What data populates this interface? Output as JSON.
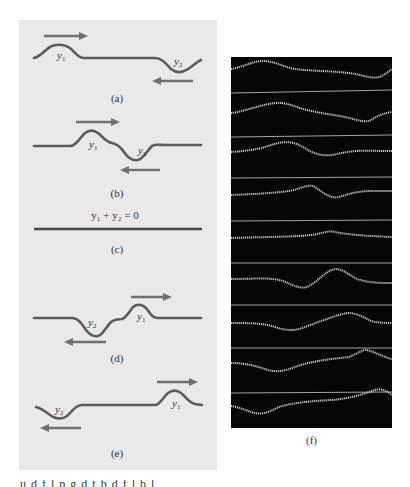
{
  "figure": {
    "panels": [
      {
        "id": "a",
        "caption": "(a)",
        "pulse1_label": "y",
        "pulse1_sub": "1",
        "pulse2_label": "y",
        "pulse2_sub": "2",
        "pulse1_direction": "right",
        "pulse2_direction": "left",
        "state": "pulses approaching"
      },
      {
        "id": "b",
        "caption": "(b)",
        "pulse1_label": "y",
        "pulse1_sub": "1",
        "pulse2_label": "y",
        "pulse2_sub": "2",
        "pulse1_direction": "right",
        "pulse2_direction": "left",
        "state": "pulses beginning to overlap"
      },
      {
        "id": "c",
        "caption": "(c)",
        "equation": "y₁ + y₂ = 0",
        "state": "complete cancellation"
      },
      {
        "id": "d",
        "caption": "(d)",
        "pulse1_label": "y",
        "pulse1_sub": "1",
        "pulse2_label": "y",
        "pulse2_sub": "2",
        "pulse1_direction": "right",
        "pulse2_direction": "left",
        "state": "pulses separating"
      },
      {
        "id": "e",
        "caption": "(e)",
        "pulse1_label": "y",
        "pulse1_sub": "1",
        "pulse2_label": "y",
        "pulse2_sub": "2",
        "pulse1_direction": "right",
        "pulse2_direction": "left",
        "state": "pulses moving apart"
      }
    ],
    "photo": {
      "caption": "(f)",
      "description": "multiflash photograph of inverted pulses on a spring passing through each other",
      "frames": 11
    },
    "cut_text": "u  d  f   l  p    g  d  t   b   d    f  l     b  l"
  },
  "colors": {
    "panel_bg": "#e9e9e9",
    "wave": "#5c5c5c",
    "arrow": "#707070",
    "photo_bg": "#050505",
    "photo_wave": "#d8d8d8"
  }
}
